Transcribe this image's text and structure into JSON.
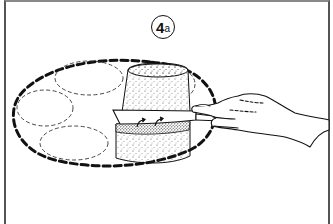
{
  "figure": {
    "step_label": {
      "number": "4",
      "suffix": "a"
    },
    "elements": {
      "tray": "dashed-oval-tray",
      "placeholders": [
        "oval-outline-1",
        "oval-outline-2",
        "oval-outline-3"
      ],
      "block": "stippled-cylinder",
      "tool": "knife",
      "actor": "hand"
    },
    "colors": {
      "line": "#111111",
      "background": "#ffffff",
      "frame": "#555555"
    }
  }
}
